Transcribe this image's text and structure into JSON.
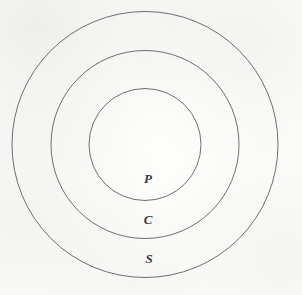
{
  "figure": {
    "name": "concentric-circles-diagram",
    "background_color": "#fdfdfc",
    "stroke_color": "#6e6e6e",
    "label_color": "#3a3a3a",
    "width": 302,
    "height": 295
  },
  "chart_data": {
    "type": "diagram",
    "subtype": "concentric-circles",
    "title": "",
    "xlabel": "",
    "ylabel": "",
    "center": {
      "x": 145,
      "y": 144.5
    },
    "rings": [
      {
        "id": "outer",
        "label": "S",
        "radius": 133,
        "label_position": {
          "x": 149,
          "y": 258
        },
        "stroke": "#6e6e6e",
        "fill": "none"
      },
      {
        "id": "middle",
        "label": "C",
        "radius": 94,
        "label_position": {
          "x": 148,
          "y": 219
        },
        "stroke": "#6e6e6e",
        "fill": "none"
      },
      {
        "id": "inner",
        "label": "P",
        "radius": 56,
        "label_position": {
          "x": 148,
          "y": 178
        },
        "stroke": "#6e6e6e",
        "fill": "none"
      }
    ],
    "labels": [
      "S",
      "C",
      "P"
    ]
  }
}
